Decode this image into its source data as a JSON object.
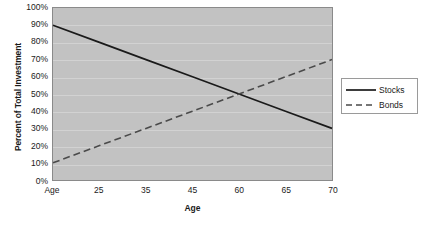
{
  "chart_data": {
    "type": "line",
    "title": "",
    "xlabel": "Age",
    "ylabel": "Percent of Total Investment",
    "categories": [
      "Age",
      "25",
      "35",
      "45",
      "60",
      "65",
      "70"
    ],
    "ytick_labels": [
      "100%",
      "90%",
      "80%",
      "70%",
      "60%",
      "50%",
      "40%",
      "30%",
      "20%",
      "10%",
      "0%"
    ],
    "ytick_values": [
      100,
      90,
      80,
      70,
      60,
      50,
      40,
      30,
      20,
      10,
      0
    ],
    "ylim": [
      0,
      100
    ],
    "grid": "horizontal",
    "legend_position": "right",
    "series": [
      {
        "name": "Stocks",
        "style": "solid",
        "color": "#1a1a1a",
        "values": [
          90,
          80,
          70,
          60,
          50,
          40,
          30
        ]
      },
      {
        "name": "Bonds",
        "style": "dashed",
        "color": "#4a4a4a",
        "values": [
          10,
          20,
          30,
          40,
          50,
          60,
          70
        ]
      }
    ],
    "plot_background": "#c2c2c2",
    "gridline_color": "#d2d2d2",
    "border_color": "#8a8a8a"
  },
  "legend": {
    "items": [
      {
        "label": "Stocks"
      },
      {
        "label": "Bonds"
      }
    ]
  }
}
